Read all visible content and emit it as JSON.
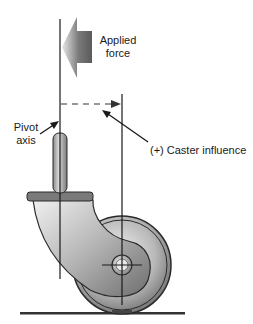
{
  "diagram": {
    "labels": {
      "applied_force_line1": "Applied",
      "applied_force_line2": "force",
      "pivot_axis_line1": "Pivot",
      "pivot_axis_line2": "axis",
      "caster_influence": "(+) Caster influence"
    },
    "components": [
      "applied-force-arrow",
      "pivot-axis-line",
      "caster-influence-line",
      "dashed-offset-arrow",
      "caster-stem",
      "mounting-plate",
      "fork",
      "wheel",
      "axle",
      "ground"
    ],
    "colors": {
      "line": "#1a1a1a",
      "metal_dark": "#5a5a5a",
      "metal_light": "#e0e0e0",
      "background": "#ffffff"
    }
  }
}
